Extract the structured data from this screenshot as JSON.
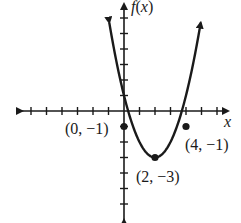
{
  "chart_data": {
    "type": "line",
    "title": "",
    "function": "f(x) = (x - 2)^2 - 3",
    "xlabel": "x",
    "ylabel": "f(x)",
    "xlim": [
      -7,
      7
    ],
    "ylim": [
      -7,
      7
    ],
    "grid": false,
    "points": [
      {
        "x": 0,
        "y": -1,
        "label": "(0, −1)"
      },
      {
        "x": 2,
        "y": -3,
        "label": "(2, −3)"
      },
      {
        "x": 4,
        "y": -1,
        "label": "(4, −1)"
      }
    ],
    "vertex": {
      "x": 2,
      "y": -3
    }
  },
  "labels": {
    "x_axis": "x",
    "y_axis": "f(x)",
    "p0": "(0, −1)",
    "p1": "(2, −3)",
    "p2": "(4, −1)"
  }
}
